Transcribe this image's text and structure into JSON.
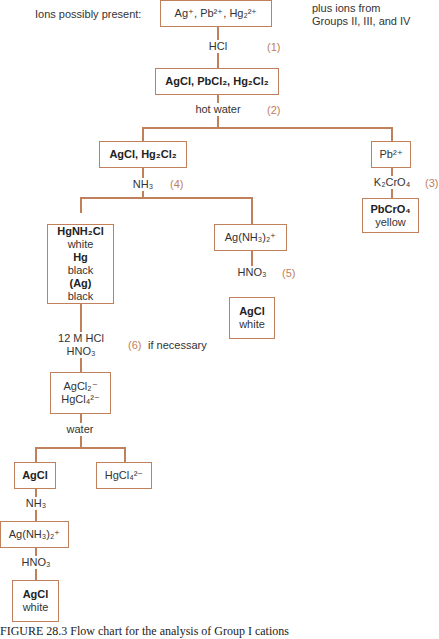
{
  "header": {
    "label": "Ions possibly present:",
    "note_line1": "plus ions from",
    "note_line2": "Groups II, III, and IV"
  },
  "nodes": {
    "start": "Ag⁺, Pb²⁺, Hg₂²⁺",
    "precip1": "AgCl, PbCl₂, Hg₂Cl₂",
    "agcl_hg2cl2": "AgCl, Hg₂Cl₂",
    "pb": "Pb²⁺",
    "pbcro4": {
      "formula": "PbCrO₄",
      "color": "yellow"
    },
    "hg_residue": {
      "l1": "HgNH₂Cl",
      "l2": "white",
      "l3": "Hg",
      "l4": "black",
      "l5": "(Ag)",
      "l6": "black"
    },
    "ag_amine": "Ag(NH₃)₂⁺",
    "agcl_white": {
      "formula": "AgCl",
      "color": "white"
    },
    "complex": {
      "l1": "AgCl₂⁻",
      "l2": "HgCl₄²⁻"
    },
    "agcl2": "AgCl",
    "hgcl4": "HgCl₄²⁻",
    "ag_amine2": "Ag(NH₃)₂⁺",
    "agcl_white2": {
      "formula": "AgCl",
      "color": "white"
    }
  },
  "reagents": {
    "hcl": "HCl",
    "hot_water": "hot water",
    "k2cro4": "K₂CrO₄",
    "nh3": "NH₃",
    "hno3": "HNO₃",
    "hcl12_l1": "12 M HCl",
    "hcl12_l2": "HNO₃",
    "if_necessary": "if necessary",
    "water": "water",
    "nh3_2": "NH₃",
    "hno3_2": "HNO₃"
  },
  "steps": {
    "s1": "(1)",
    "s2": "(2)",
    "s3": "(3)",
    "s4": "(4)",
    "s5": "(5)",
    "s6": "(6)"
  },
  "caption": "FIGURE 28.3   Flow chart for the analysis of Group I cations",
  "colors": {
    "line": "#c0805c",
    "step": "#c0805c"
  }
}
